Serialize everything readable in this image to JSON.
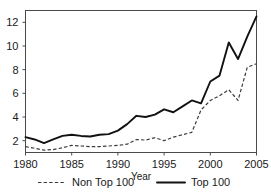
{
  "chart_data": {
    "type": "line",
    "title": "",
    "xlabel": "Year",
    "ylabel": "",
    "xlim": [
      1980,
      2005
    ],
    "ylim": [
      1.0,
      13.0
    ],
    "grid": false,
    "legend_position": "bottom",
    "xticks": [
      1980,
      1985,
      1990,
      1995,
      2000,
      2005
    ],
    "xtick_labels": [
      "1980",
      "1985",
      "1990",
      "1995",
      "2000",
      "2005"
    ],
    "yticks": [
      2,
      4,
      6,
      8,
      10,
      12
    ],
    "ytick_labels": [
      "2",
      "4",
      "6",
      "8",
      "10",
      "12"
    ],
    "x": [
      1980,
      1981,
      1982,
      1983,
      1984,
      1985,
      1986,
      1987,
      1988,
      1989,
      1990,
      1991,
      1992,
      1993,
      1994,
      1995,
      1996,
      1997,
      1998,
      1999,
      2000,
      2001,
      2002,
      2003,
      2004,
      2005
    ],
    "series": [
      {
        "name": "Non Top 100",
        "style": "dashed",
        "color": "#3a3a3a",
        "values": [
          1.5,
          1.35,
          1.2,
          1.25,
          1.4,
          1.6,
          1.55,
          1.5,
          1.5,
          1.55,
          1.6,
          1.7,
          2.1,
          2.05,
          2.25,
          2.0,
          2.3,
          2.5,
          2.7,
          4.6,
          5.4,
          5.8,
          6.3,
          5.4,
          8.2,
          8.5
        ]
      },
      {
        "name": "Top 100",
        "style": "solid",
        "color": "#111111",
        "values": [
          2.3,
          2.1,
          1.8,
          2.1,
          2.4,
          2.5,
          2.4,
          2.35,
          2.5,
          2.55,
          2.85,
          3.4,
          4.1,
          4.0,
          4.2,
          4.65,
          4.4,
          4.9,
          5.4,
          5.15,
          7.0,
          7.5,
          10.3,
          8.9,
          10.8,
          12.5
        ]
      }
    ],
    "legend": [
      {
        "label": "Non Top 100",
        "style": "dashed"
      },
      {
        "label": "Top 100",
        "style": "solid"
      }
    ]
  }
}
